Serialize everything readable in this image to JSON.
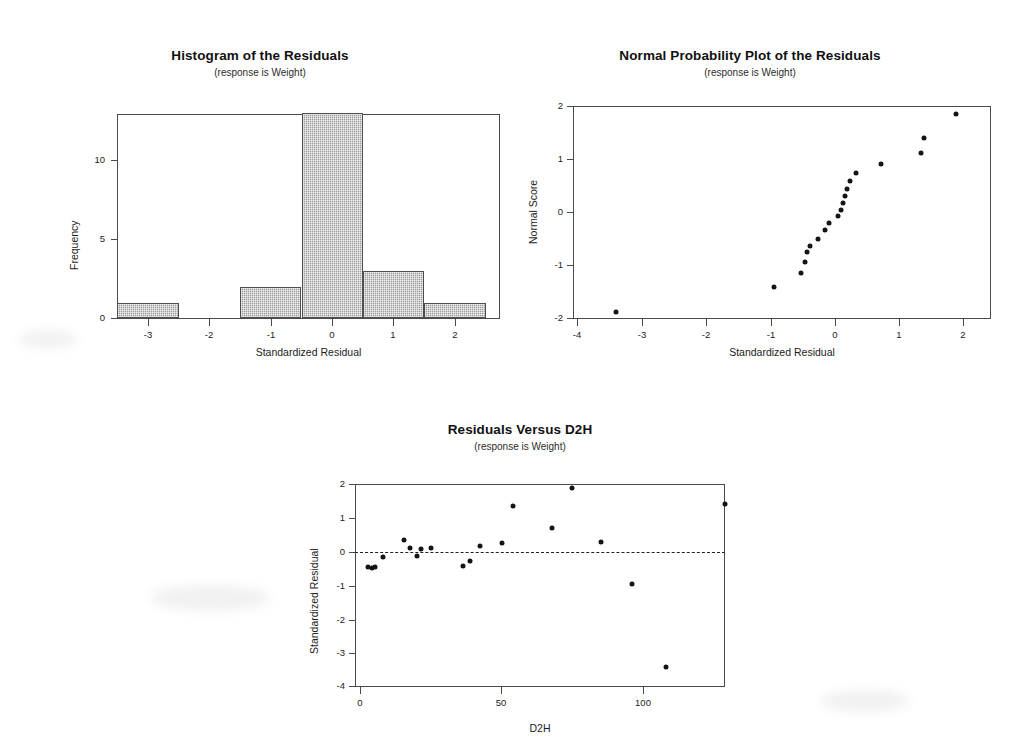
{
  "page": {
    "background": "#ffffff",
    "ink": "#141414",
    "bar_fill": "#9b9b9b",
    "axis_color": "#4a4a4a"
  },
  "charts": [
    {
      "id": "histogram-residuals",
      "title": "Histogram of the Residuals",
      "subtitle": "(response is Weight)",
      "xlabel": "Standardized Residual",
      "ylabel": "Frequency",
      "xticks": [
        "-3",
        "-2",
        "-1",
        "0",
        "1",
        "2"
      ],
      "yticks": [
        "0",
        "5",
        "10"
      ]
    },
    {
      "id": "normal-probability-plot",
      "title": "Normal Probability Plot of the Residuals",
      "subtitle": "(response is Weight)",
      "xlabel": "Standardized Residual",
      "ylabel": "Normal Score",
      "xticks": [
        "-4",
        "-3",
        "-2",
        "-1",
        "0",
        "1",
        "2"
      ],
      "yticks": [
        "-2",
        "-1",
        "0",
        "1",
        "2"
      ]
    },
    {
      "id": "residuals-versus-d2h",
      "title": "Residuals Versus D2H",
      "subtitle": "(response is Weight)",
      "xlabel": "D2H",
      "ylabel": "Standardized Residual",
      "xticks": [
        "0",
        "50",
        "100"
      ],
      "yticks": [
        "-4",
        "-3",
        "-2",
        "-1",
        "0",
        "1",
        "2"
      ]
    }
  ],
  "chart_data": [
    {
      "type": "bar",
      "id": "histogram-residuals",
      "title": "Histogram of the Residuals",
      "subtitle": "(response is Weight)",
      "xlabel": "Standardized Residual",
      "ylabel": "Frequency",
      "grid": false,
      "legend": "none",
      "xlim": [
        -3.5,
        2.5
      ],
      "ylim": [
        0,
        13.6
      ],
      "bin_width": 1,
      "bin_edges": [
        -3.5,
        -2.5,
        -1.5,
        -0.5,
        0.5,
        1.5,
        2.5
      ],
      "categories": [
        "-3",
        "-2",
        "-1",
        "0",
        "1",
        "2"
      ],
      "bin_centers": [
        -3,
        -2,
        -1,
        0,
        1,
        2
      ],
      "values": [
        1,
        0,
        2,
        13,
        3,
        1
      ],
      "xtick_values": [
        -3,
        -2,
        -1,
        0,
        1,
        2
      ],
      "ytick_values": [
        0,
        5,
        10
      ]
    },
    {
      "type": "scatter",
      "id": "normal-probability-plot",
      "title": "Normal Probability Plot of the Residuals",
      "subtitle": "(response is Weight)",
      "xlabel": "Standardized Residual",
      "ylabel": "Normal Score",
      "grid": false,
      "legend": "none",
      "xlim": [
        -4,
        2.2
      ],
      "ylim": [
        -2.05,
        2.05
      ],
      "xtick_values": [
        -4,
        -3,
        -2,
        -1,
        0,
        1,
        2
      ],
      "ytick_values": [
        -2,
        -1,
        0,
        1,
        2
      ],
      "points": [
        {
          "x": -3.4,
          "y": -1.87
        },
        {
          "x": -0.94,
          "y": -1.4
        },
        {
          "x": -0.52,
          "y": -1.14
        },
        {
          "x": -0.46,
          "y": -0.93
        },
        {
          "x": -0.43,
          "y": -0.75
        },
        {
          "x": -0.38,
          "y": -0.63
        },
        {
          "x": -0.26,
          "y": -0.5
        },
        {
          "x": -0.14,
          "y": -0.34
        },
        {
          "x": -0.08,
          "y": -0.2
        },
        {
          "x": 0.06,
          "y": -0.07
        },
        {
          "x": 0.1,
          "y": 0.05
        },
        {
          "x": 0.13,
          "y": 0.18
        },
        {
          "x": 0.16,
          "y": 0.3
        },
        {
          "x": 0.2,
          "y": 0.44
        },
        {
          "x": 0.25,
          "y": 0.58
        },
        {
          "x": 0.33,
          "y": 0.74
        },
        {
          "x": 0.73,
          "y": 0.9
        },
        {
          "x": 1.35,
          "y": 1.11
        },
        {
          "x": 1.4,
          "y": 1.39
        },
        {
          "x": 1.89,
          "y": 1.85
        }
      ]
    },
    {
      "type": "scatter",
      "id": "residuals-versus-d2h",
      "title": "Residuals Versus D2H",
      "subtitle": "(response is Weight)",
      "xlabel": "D2H",
      "ylabel": "Standardized Residual",
      "grid": false,
      "legend": "none",
      "xlim": [
        -2,
        136
      ],
      "ylim": [
        -4.15,
        2.15
      ],
      "xtick_values": [
        0,
        50,
        100
      ],
      "ytick_values": [
        -4,
        -3,
        -2,
        -1,
        0,
        1,
        2
      ],
      "reference_line": {
        "y": 0,
        "style": "dashed"
      },
      "points": [
        {
          "x": 3.0,
          "y": -0.47
        },
        {
          "x": 4.2,
          "y": -0.5
        },
        {
          "x": 5.2,
          "y": -0.45
        },
        {
          "x": 8.0,
          "y": -0.15
        },
        {
          "x": 15.5,
          "y": 0.34
        },
        {
          "x": 17.5,
          "y": 0.1
        },
        {
          "x": 20.0,
          "y": -0.12
        },
        {
          "x": 21.5,
          "y": 0.06
        },
        {
          "x": 25.0,
          "y": 0.11
        },
        {
          "x": 36.5,
          "y": -0.42
        },
        {
          "x": 39.0,
          "y": -0.27
        },
        {
          "x": 42.5,
          "y": 0.16
        },
        {
          "x": 50.0,
          "y": 0.25
        },
        {
          "x": 54.0,
          "y": 1.34
        },
        {
          "x": 68.0,
          "y": 0.7
        },
        {
          "x": 75.0,
          "y": 1.87
        },
        {
          "x": 85.0,
          "y": 0.27
        },
        {
          "x": 96.0,
          "y": -0.95
        },
        {
          "x": 108.0,
          "y": -3.41
        },
        {
          "x": 129.0,
          "y": 1.4
        }
      ]
    }
  ]
}
